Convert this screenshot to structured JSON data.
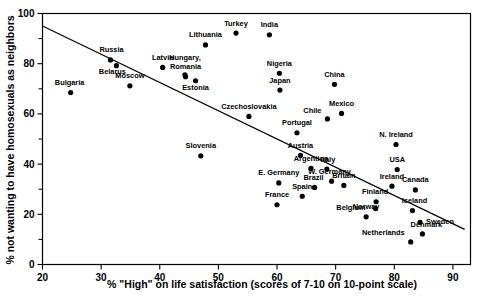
{
  "chart_data": {
    "type": "scatter",
    "title": "",
    "xlabel": "% \"High\" on life satisfaction (scores of 7-10 on 10-point scale)",
    "ylabel": "% not wanting to have homosexuals as neighbors",
    "xlim": [
      20,
      93
    ],
    "ylim": [
      0,
      100
    ],
    "xticks": [
      20,
      30,
      40,
      50,
      60,
      70,
      80,
      90
    ],
    "yticks": [
      0,
      20,
      40,
      60,
      80,
      100
    ],
    "yminor": [
      10,
      30,
      50,
      70,
      90
    ],
    "grid": false,
    "legend": false,
    "trendline": {
      "x1": 20,
      "y1": 95,
      "x2": 92,
      "y2": 14
    },
    "points": [
      {
        "label": "Bulgaria",
        "x": 24.8,
        "y": 68.5,
        "lx": -1,
        "ly": -7.5,
        "anchor": "middle"
      },
      {
        "label": "Russia",
        "x": 31.6,
        "y": 81.5,
        "lx": 1,
        "ly": -7.5,
        "anchor": "middle"
      },
      {
        "label": "Belarus",
        "x": 32.6,
        "y": 79.2,
        "lx": -4,
        "ly": 8.5,
        "anchor": "middle"
      },
      {
        "label": "Moscow",
        "x": 34.9,
        "y": 71.2,
        "lx": 0,
        "ly": -7.5,
        "anchor": "middle"
      },
      {
        "label": "Latvia",
        "x": 40.5,
        "y": 78.5,
        "lx": 0,
        "ly": -7.5,
        "anchor": "middle"
      },
      {
        "label": "Hungary,",
        "x": 44.3,
        "y": 75.6,
        "lx": 0,
        "ly": -15,
        "anchor": "middle"
      },
      {
        "label": "Romania",
        "x": 44.4,
        "y": 74.8,
        "lx": 0,
        "ly": -7.5,
        "anchor": "middle"
      },
      {
        "label": "Estonia",
        "x": 46.1,
        "y": 73.2,
        "lx": 0,
        "ly": 9,
        "anchor": "middle"
      },
      {
        "label": "Lithuania",
        "x": 47.8,
        "y": 87.5,
        "lx": 0,
        "ly": -7.5,
        "anchor": "middle"
      },
      {
        "label": "Turkey",
        "x": 53.0,
        "y": 92.2,
        "lx": 0,
        "ly": -7.5,
        "anchor": "middle"
      },
      {
        "label": "India",
        "x": 58.7,
        "y": 91.5,
        "lx": 0,
        "ly": -7.5,
        "anchor": "middle"
      },
      {
        "label": "Nigeria",
        "x": 60.4,
        "y": 76.2,
        "lx": 0,
        "ly": -7.5,
        "anchor": "middle"
      },
      {
        "label": "Japan",
        "x": 60.5,
        "y": 69.5,
        "lx": 0,
        "ly": -7.5,
        "anchor": "middle"
      },
      {
        "label": "Czechoslovakia",
        "x": 55.2,
        "y": 59.0,
        "lx": 0,
        "ly": -7.5,
        "anchor": "middle"
      },
      {
        "label": "China",
        "x": 69.8,
        "y": 71.8,
        "lx": 0,
        "ly": -7.5,
        "anchor": "middle"
      },
      {
        "label": "Chile",
        "x": 68.6,
        "y": 58.0,
        "lx": -6,
        "ly": -6,
        "anchor": "end"
      },
      {
        "label": "Mexico",
        "x": 71.0,
        "y": 60.2,
        "lx": 0,
        "ly": -7.5,
        "anchor": "middle"
      },
      {
        "label": "Slovenia",
        "x": 47.0,
        "y": 43.3,
        "lx": 0,
        "ly": -7.5,
        "anchor": "middle"
      },
      {
        "label": "Portugal",
        "x": 63.4,
        "y": 52.5,
        "lx": 0,
        "ly": -7.5,
        "anchor": "middle"
      },
      {
        "label": "Austria",
        "x": 64.0,
        "y": 43.5,
        "lx": 0,
        "ly": -7.5,
        "anchor": "middle"
      },
      {
        "label": "Argentina",
        "x": 65.8,
        "y": 38.3,
        "lx": 0,
        "ly": -7.5,
        "anchor": "middle"
      },
      {
        "label": "Italy",
        "x": 68.5,
        "y": 38.0,
        "lx": 1,
        "ly": -7.5,
        "anchor": "middle"
      },
      {
        "label": "W. Germany",
        "x": 69.3,
        "y": 33.2,
        "lx": -2,
        "ly": -7.5,
        "anchor": "middle"
      },
      {
        "label": "Britain",
        "x": 71.4,
        "y": 31.5,
        "lx": 0,
        "ly": -7.5,
        "anchor": "middle"
      },
      {
        "label": "Brazil",
        "x": 66.4,
        "y": 30.7,
        "lx": -1,
        "ly": -7.5,
        "anchor": "middle"
      },
      {
        "label": "Spain",
        "x": 64.3,
        "y": 27.2,
        "lx": 0,
        "ly": -7.5,
        "anchor": "middle"
      },
      {
        "label": "E. Germany",
        "x": 60.3,
        "y": 32.5,
        "lx": 0,
        "ly": -7.5,
        "anchor": "middle"
      },
      {
        "label": "France",
        "x": 60.0,
        "y": 23.8,
        "lx": 0,
        "ly": -7.5,
        "anchor": "middle"
      },
      {
        "label": "N. Ireland",
        "x": 80.3,
        "y": 47.8,
        "lx": 0,
        "ly": -7.5,
        "anchor": "middle"
      },
      {
        "label": "USA",
        "x": 80.5,
        "y": 37.8,
        "lx": 0,
        "ly": -7.5,
        "anchor": "middle"
      },
      {
        "label": "Ireland",
        "x": 79.6,
        "y": 31.2,
        "lx": 0,
        "ly": -7.5,
        "anchor": "middle"
      },
      {
        "label": "Canada",
        "x": 83.6,
        "y": 29.7,
        "lx": 0,
        "ly": -7.5,
        "anchor": "middle"
      },
      {
        "label": "Finland",
        "x": 76.9,
        "y": 25.0,
        "lx": -1,
        "ly": -7.5,
        "anchor": "middle"
      },
      {
        "label": "Belgium",
        "x": 76.8,
        "y": 22.3,
        "lx": -10,
        "ly": 1.5,
        "anchor": "end"
      },
      {
        "label": "Norway",
        "x": 75.2,
        "y": 19.0,
        "lx": 0,
        "ly": -7.5,
        "anchor": "middle"
      },
      {
        "label": "Iceland",
        "x": 83.1,
        "y": 21.5,
        "lx": 2,
        "ly": -7.5,
        "anchor": "middle"
      },
      {
        "label": "Sweden",
        "x": 84.4,
        "y": 16.8,
        "lx": 6,
        "ly": 1.5,
        "anchor": "start"
      },
      {
        "label": "Denmark",
        "x": 84.8,
        "y": 12.2,
        "lx": 4,
        "ly": -6.5,
        "anchor": "middle"
      },
      {
        "label": "Netherlands",
        "x": 82.8,
        "y": 9.0,
        "lx": -6,
        "ly": -6.5,
        "anchor": "end"
      }
    ]
  }
}
